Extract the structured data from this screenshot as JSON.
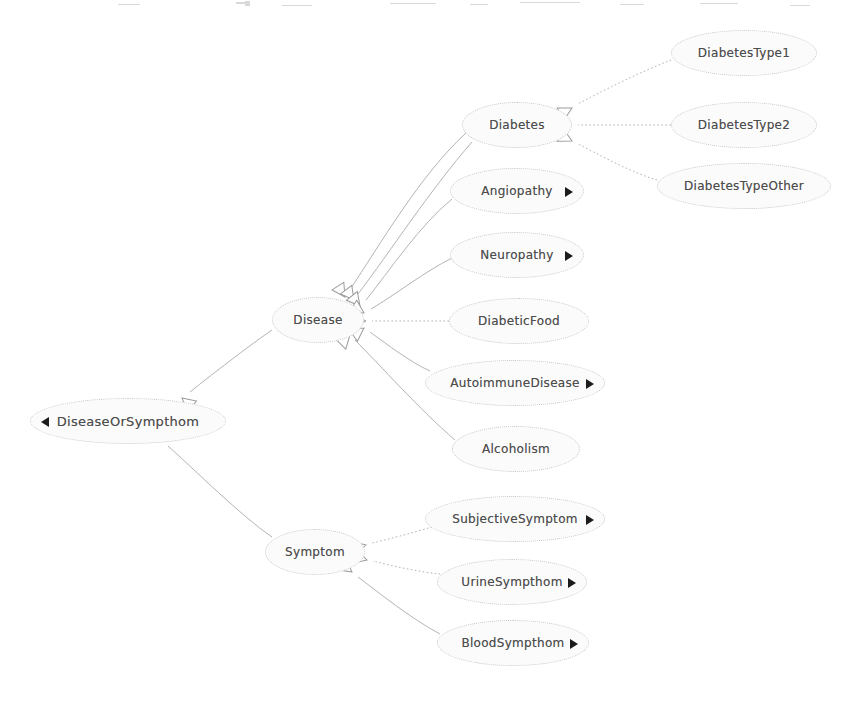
{
  "diagram": {
    "type": "uml-generalization-tree",
    "canvas": {
      "width": 848,
      "height": 702
    },
    "style": {
      "node_fill": "#fbfbfb",
      "node_border": "#c9c9c9",
      "text_color": "#4d4d4d",
      "edge_color": "#b4b4b4",
      "marker_color": "#1b1b1b",
      "background": "#ffffff"
    },
    "nodes": [
      {
        "id": "diseaseOrSympthom",
        "label": "DiseaseOrSympthom",
        "x": 30,
        "y": 398,
        "w": 196,
        "h": 46,
        "font": 13,
        "marker": "left",
        "marker_name": "collapse-triangle-icon"
      },
      {
        "id": "disease",
        "label": "Disease",
        "x": 272,
        "y": 297,
        "w": 92,
        "h": 46,
        "font": 12,
        "marker": "none",
        "marker_name": ""
      },
      {
        "id": "symptom",
        "label": "Symptom",
        "x": 265,
        "y": 529,
        "w": 100,
        "h": 46,
        "font": 12,
        "marker": "none",
        "marker_name": ""
      },
      {
        "id": "diabetes",
        "label": "Diabetes",
        "x": 462,
        "y": 102,
        "w": 110,
        "h": 46,
        "font": 12,
        "marker": "none",
        "marker_name": ""
      },
      {
        "id": "diabetesType1",
        "label": "DiabetesType1",
        "x": 671,
        "y": 30,
        "w": 146,
        "h": 46,
        "font": 12,
        "marker": "none",
        "marker_name": ""
      },
      {
        "id": "diabetesType2",
        "label": "DiabetesType2",
        "x": 671,
        "y": 102,
        "w": 146,
        "h": 46,
        "font": 12,
        "marker": "none",
        "marker_name": ""
      },
      {
        "id": "diabetesTypeOther",
        "label": "DiabetesTypeOther",
        "x": 657,
        "y": 163,
        "w": 174,
        "h": 46,
        "font": 12,
        "marker": "none",
        "marker_name": ""
      },
      {
        "id": "angiopathy",
        "label": "Angiopathy",
        "x": 450,
        "y": 168,
        "w": 134,
        "h": 46,
        "font": 12,
        "marker": "right",
        "marker_name": "expand-triangle-icon"
      },
      {
        "id": "neuropathy",
        "label": "Neuropathy",
        "x": 450,
        "y": 232,
        "w": 134,
        "h": 46,
        "font": 12,
        "marker": "right",
        "marker_name": "expand-triangle-icon"
      },
      {
        "id": "diabeticFood",
        "label": "DiabeticFood",
        "x": 449,
        "y": 298,
        "w": 140,
        "h": 46,
        "font": 12,
        "marker": "none",
        "marker_name": ""
      },
      {
        "id": "autoimmuneDisease",
        "label": "AutoimmuneDisease",
        "x": 425,
        "y": 360,
        "w": 180,
        "h": 46,
        "font": 12,
        "marker": "right",
        "marker_name": "expand-triangle-icon"
      },
      {
        "id": "alcoholism",
        "label": "Alcoholism",
        "x": 452,
        "y": 426,
        "w": 128,
        "h": 46,
        "font": 12,
        "marker": "none",
        "marker_name": ""
      },
      {
        "id": "subjectiveSymptom",
        "label": "SubjectiveSymptom",
        "x": 425,
        "y": 496,
        "w": 180,
        "h": 46,
        "font": 12,
        "marker": "right",
        "marker_name": "expand-triangle-icon"
      },
      {
        "id": "urineSympthom",
        "label": "UrineSympthom",
        "x": 437,
        "y": 559,
        "w": 150,
        "h": 46,
        "font": 12,
        "marker": "right",
        "marker_name": "expand-triangle-icon"
      },
      {
        "id": "bloodSympthom",
        "label": "BloodSympthom",
        "x": 437,
        "y": 620,
        "w": 152,
        "h": 46,
        "font": 12,
        "marker": "right",
        "marker_name": "expand-triangle-icon"
      }
    ],
    "edges": [
      {
        "from": "disease",
        "to": "diseaseOrSympthom",
        "style": "solid",
        "arrow": "hollow-triangle"
      },
      {
        "from": "symptom",
        "to": "diseaseOrSympthom",
        "style": "solid",
        "arrow": "hollow-triangle"
      },
      {
        "from": "diabetes",
        "to": "disease",
        "style": "solid",
        "arrow": "hollow-triangle"
      },
      {
        "from": "angiopathy",
        "to": "disease",
        "style": "solid",
        "arrow": "hollow-triangle"
      },
      {
        "from": "neuropathy",
        "to": "disease",
        "style": "solid",
        "arrow": "hollow-triangle"
      },
      {
        "from": "diabeticFood",
        "to": "disease",
        "style": "dotted",
        "arrow": "hollow-triangle"
      },
      {
        "from": "autoimmuneDisease",
        "to": "disease",
        "style": "solid",
        "arrow": "hollow-triangle"
      },
      {
        "from": "alcoholism",
        "to": "disease",
        "style": "solid",
        "arrow": "hollow-triangle"
      },
      {
        "from": "diabetesType1",
        "to": "diabetes",
        "style": "dotted",
        "arrow": "hollow-triangle"
      },
      {
        "from": "diabetesType2",
        "to": "diabetes",
        "style": "dotted",
        "arrow": "hollow-triangle"
      },
      {
        "from": "diabetesTypeOther",
        "to": "diabetes",
        "style": "dotted",
        "arrow": "hollow-triangle"
      },
      {
        "from": "subjectiveSymptom",
        "to": "symptom",
        "style": "dotted",
        "arrow": "hollow-triangle"
      },
      {
        "from": "urineSympthom",
        "to": "symptom",
        "style": "dotted",
        "arrow": "hollow-triangle"
      },
      {
        "from": "bloodSympthom",
        "to": "symptom",
        "style": "solid",
        "arrow": "hollow-triangle"
      }
    ],
    "edge_paths": [
      {
        "name": "edge-disease-to-diseaseOrSympthom",
        "d": "M 272 330 C 250 345, 215 372, 190 392",
        "style": "solid",
        "tip": [
          182,
          398
        ],
        "ang": 40
      },
      {
        "name": "edge-symptom-to-diseaseOrSympthom",
        "d": "M 272 537 C 240 515, 195 470, 168 446",
        "style": "solid",
        "tip": [
          162,
          440
        ],
        "ang": 222
      },
      {
        "name": "edge-diabetes-to-disease",
        "d": "M 466 133 C 420 175, 380 245, 349 291",
        "style": "solid",
        "tip": [
          345,
          297
        ],
        "ang": 237
      },
      {
        "name": "edge-diabetes2-to-disease",
        "d": "M 472 142 C 430 190, 390 252, 358 294",
        "style": "solid",
        "tip": [
          354,
          300
        ],
        "ang": 233
      },
      {
        "name": "edge-angiopathy-to-disease",
        "d": "M 452 199 C 420 225, 390 270, 366 300",
        "style": "solid",
        "tip": [
          360,
          306
        ],
        "ang": 231
      },
      {
        "name": "edge-neuropathy-to-disease",
        "d": "M 452 258 C 424 272, 395 295, 371 309",
        "style": "solid",
        "tip": [
          364,
          313
        ],
        "ang": 212
      },
      {
        "name": "edge-diabeticFood-to-disease",
        "d": "M 449 321 L 372 321",
        "style": "dotted",
        "tip": [
          366,
          321
        ],
        "ang": 180
      },
      {
        "name": "edge-autoimmune-to-disease",
        "d": "M 430 371 C 410 362, 388 345, 370 332",
        "style": "solid",
        "tip": [
          364,
          328
        ],
        "ang": 145
      },
      {
        "name": "edge-alcoholism-to-disease",
        "d": "M 455 440 C 420 410, 380 365, 355 340",
        "style": "solid",
        "tip": [
          350,
          335
        ],
        "ang": 135
      },
      {
        "name": "edge-type1-to-diabetes",
        "d": "M 671 60 C 640 72, 600 92, 578 104",
        "style": "dotted",
        "tip": [
          572,
          108
        ],
        "ang": 152
      },
      {
        "name": "edge-type2-to-diabetes",
        "d": "M 671 125 L 578 125",
        "style": "dotted",
        "tip": [
          572,
          125
        ],
        "ang": 180
      },
      {
        "name": "edge-typeOther-to-diabetes",
        "d": "M 657 180 C 630 172, 600 155, 578 144",
        "style": "dotted",
        "tip": [
          572,
          141
        ],
        "ang": 207
      },
      {
        "name": "edge-subjective-to-symptom",
        "d": "M 432 527 C 415 532, 390 539, 372 543",
        "style": "dotted",
        "tip": [
          366,
          545
        ],
        "ang": 166
      },
      {
        "name": "edge-urine-to-symptom",
        "d": "M 440 574 C 420 572, 392 566, 373 561",
        "style": "dotted",
        "tip": [
          367,
          560
        ],
        "ang": 195
      },
      {
        "name": "edge-blood-to-symptom",
        "d": "M 440 634 C 410 618, 378 592, 358 577",
        "style": "solid",
        "tip": [
          352,
          572
        ],
        "ang": 217
      }
    ]
  }
}
